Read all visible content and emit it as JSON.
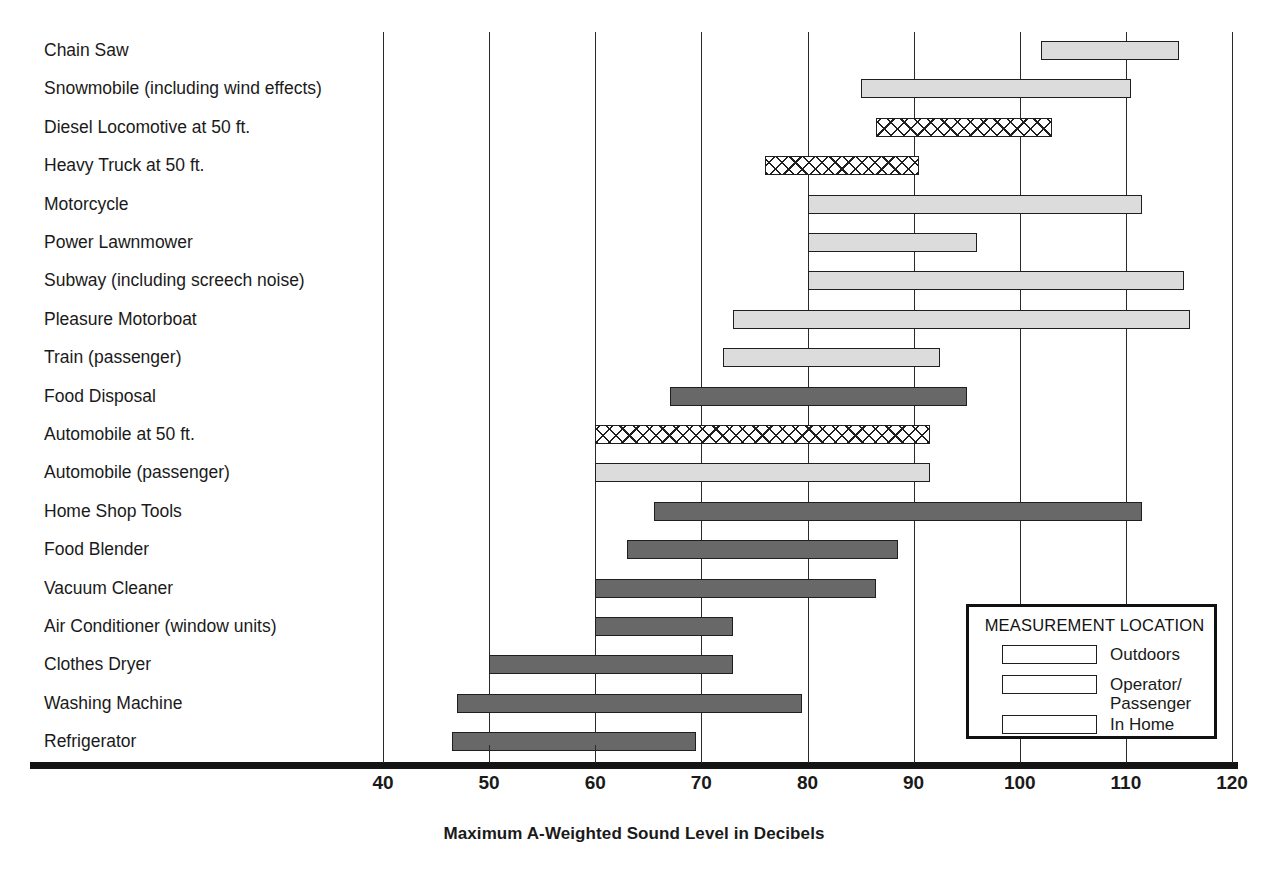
{
  "chart_data": {
    "type": "bar",
    "orientation": "horizontal",
    "subtype": "range-bar",
    "title": "",
    "xlabel": "Maximum A-Weighted Sound Level in Decibels",
    "ylabel": "",
    "xlim": [
      40,
      120
    ],
    "xticks": [
      40,
      50,
      60,
      70,
      80,
      90,
      100,
      110,
      120
    ],
    "grid": "vertical",
    "legend_position": "inside-bottom-right",
    "categories": [
      "Chain Saw",
      "Snowmobile (including wind effects)",
      "Diesel Locomotive at 50 ft.",
      "Heavy Truck at 50 ft.",
      "Motorcycle",
      "Power Lawnmower",
      "Subway (including screech noise)",
      "Pleasure Motorboat",
      "Train (passenger)",
      "Food Disposal",
      "Automobile at 50 ft.",
      "Automobile (passenger)",
      "Home Shop Tools",
      "Food Blender",
      "Vacuum Cleaner",
      "Air Conditioner (window units)",
      "Clothes Dryer",
      "Washing Machine",
      "Refrigerator"
    ],
    "series": [
      {
        "name": "Outdoors",
        "key": "outdoors",
        "pattern": "cross-hatch",
        "color": "#ffffff"
      },
      {
        "name": "Operator/\nPassenger",
        "key": "operator",
        "pattern": "solid",
        "color": "#dcdcdc"
      },
      {
        "name": "In Home",
        "key": "in-home",
        "pattern": "solid",
        "color": "#686868"
      }
    ],
    "bars": [
      {
        "label": "Chain Saw",
        "low": 102,
        "high": 115,
        "group": "operator"
      },
      {
        "label": "Snowmobile (including wind effects)",
        "low": 85,
        "high": 110.5,
        "group": "operator"
      },
      {
        "label": "Diesel Locomotive at 50 ft.",
        "low": 86.5,
        "high": 103,
        "group": "outdoors"
      },
      {
        "label": "Heavy Truck at 50 ft.",
        "low": 76,
        "high": 90.5,
        "group": "outdoors"
      },
      {
        "label": "Motorcycle",
        "low": 80,
        "high": 111.5,
        "group": "operator"
      },
      {
        "label": "Power Lawnmower",
        "low": 80,
        "high": 96,
        "group": "operator"
      },
      {
        "label": "Subway (including screech noise)",
        "low": 80,
        "high": 115.5,
        "group": "operator"
      },
      {
        "label": "Pleasure Motorboat",
        "low": 73,
        "high": 116,
        "group": "operator"
      },
      {
        "label": "Train (passenger)",
        "low": 72,
        "high": 92.5,
        "group": "operator"
      },
      {
        "label": "Food Disposal",
        "low": 67,
        "high": 95,
        "group": "in-home"
      },
      {
        "label": "Automobile at 50 ft.",
        "low": 60,
        "high": 91.5,
        "group": "outdoors"
      },
      {
        "label": "Automobile (passenger)",
        "low": 60,
        "high": 91.5,
        "group": "operator"
      },
      {
        "label": "Home Shop Tools",
        "low": 65.5,
        "high": 111.5,
        "group": "in-home"
      },
      {
        "label": "Food Blender",
        "low": 63,
        "high": 88.5,
        "group": "in-home"
      },
      {
        "label": "Vacuum Cleaner",
        "low": 60,
        "high": 86.5,
        "group": "in-home"
      },
      {
        "label": "Air Conditioner (window units)",
        "low": 60,
        "high": 73,
        "group": "in-home"
      },
      {
        "label": "Clothes Dryer",
        "low": 50,
        "high": 73,
        "group": "in-home"
      },
      {
        "label": "Washing Machine",
        "low": 47,
        "high": 79.5,
        "group": "in-home"
      },
      {
        "label": "Refrigerator",
        "low": 46.5,
        "high": 69.5,
        "group": "in-home"
      }
    ]
  },
  "legend": {
    "title": "MEASUREMENT LOCATION",
    "items": [
      {
        "label": "Outdoors",
        "key": "outdoors"
      },
      {
        "label": "Operator/\nPassenger",
        "key": "operator"
      },
      {
        "label": "In Home",
        "key": "in-home"
      }
    ]
  },
  "colors": {
    "in_home": "#686868",
    "operator_passenger": "#dcdcdc",
    "outdoors_fill": "#ffffff",
    "outline": "#1f1f1f",
    "axis": "#141414",
    "text": "#1a1a1a"
  }
}
